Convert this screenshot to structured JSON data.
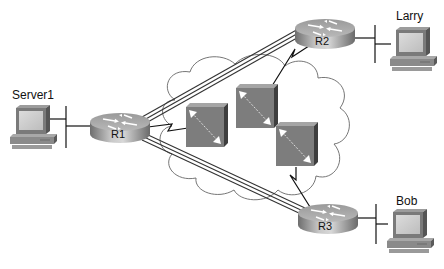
{
  "diagram": {
    "type": "network-topology",
    "nodes": {
      "server1": {
        "label": "Server1",
        "kind": "pc"
      },
      "larry": {
        "label": "Larry",
        "kind": "pc"
      },
      "bob": {
        "label": "Bob",
        "kind": "pc"
      },
      "r1": {
        "label": "R1",
        "kind": "router"
      },
      "r2": {
        "label": "R2",
        "kind": "router"
      },
      "r3": {
        "label": "R3",
        "kind": "router"
      },
      "sw1": {
        "label": "",
        "kind": "frame-relay-switch"
      },
      "sw2": {
        "label": "",
        "kind": "frame-relay-switch"
      },
      "sw3": {
        "label": "",
        "kind": "frame-relay-switch"
      }
    },
    "cloud": {
      "label": "",
      "kind": "wan-cloud"
    },
    "links": [
      {
        "from": "server1",
        "to": "r1",
        "kind": "ethernet"
      },
      {
        "from": "larry",
        "to": "r2",
        "kind": "ethernet"
      },
      {
        "from": "bob",
        "to": "r3",
        "kind": "ethernet"
      },
      {
        "from": "r1",
        "to": "sw1",
        "kind": "serial"
      },
      {
        "from": "r2",
        "to": "sw2",
        "kind": "serial"
      },
      {
        "from": "r3",
        "to": "sw3",
        "kind": "serial"
      },
      {
        "from": "r1",
        "to": "r2",
        "kind": "virtual-circuit"
      },
      {
        "from": "r1",
        "to": "r3",
        "kind": "virtual-circuit"
      }
    ]
  }
}
